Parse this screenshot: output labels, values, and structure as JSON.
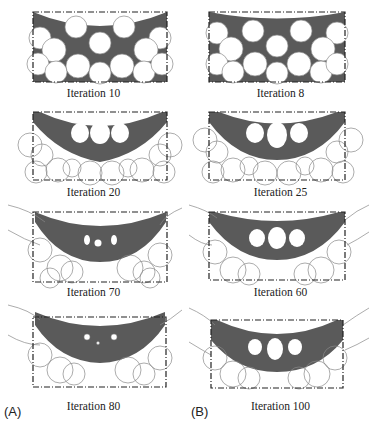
{
  "figure": {
    "column_labels": [
      "(A)",
      "(B)"
    ],
    "panels": [
      {
        "id": "A1",
        "column": "A",
        "row": 1,
        "caption": "Iteration 10",
        "holes": 14,
        "stage": "initial-circles"
      },
      {
        "id": "A2",
        "column": "A",
        "row": 2,
        "caption": "Iteration 20",
        "holes": 3,
        "stage": "arch-three-holes"
      },
      {
        "id": "A3",
        "column": "A",
        "row": 3,
        "caption": "Iteration 70",
        "holes": 3,
        "stage": "arch-small-holes"
      },
      {
        "id": "A4",
        "column": "A",
        "row": 4,
        "caption": "Iteration 80",
        "holes": 3,
        "stage": "arch-tiny-holes"
      },
      {
        "id": "B1",
        "column": "B",
        "row": 1,
        "caption": "Iteration 8",
        "holes": 14,
        "stage": "initial-circles"
      },
      {
        "id": "B2",
        "column": "B",
        "row": 2,
        "caption": "Iteration 25",
        "holes": 3,
        "stage": "arch-three-holes"
      },
      {
        "id": "B3",
        "column": "B",
        "row": 3,
        "caption": "Iteration 60",
        "holes": 3,
        "stage": "arch-three-holes"
      },
      {
        "id": "B4",
        "column": "B",
        "row": 4,
        "caption": "Iteration 100",
        "holes": 3,
        "stage": "arch-three-holes"
      }
    ],
    "colors": {
      "material": "#5a5a5a",
      "outline": "#222222",
      "level_set": "#777777",
      "background": "#ffffff"
    }
  }
}
